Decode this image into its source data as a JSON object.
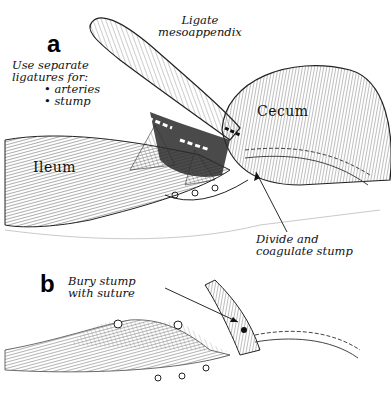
{
  "figure": {
    "panels": [
      {
        "letter": "a",
        "labels": {
          "ligate_line1": "Ligate",
          "ligate_line2": "mesoappendix",
          "use_sep_line1": "Use separate",
          "use_sep_line2": "ligatures for:",
          "bullets": [
            "arteries",
            "stump"
          ],
          "cecum": "Cecum",
          "ileum": "Ileum",
          "divide_line1": "Divide and",
          "divide_line2": "coagulate stump"
        }
      },
      {
        "letter": "b",
        "labels": {
          "bury_line1": "Bury stump",
          "bury_line2": "with suture"
        }
      }
    ],
    "colors": {
      "ink": "#111111",
      "background": "#ffffff",
      "shade": "#888888"
    }
  }
}
